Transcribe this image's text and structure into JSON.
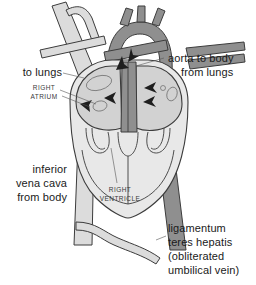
{
  "figure": {
    "background_color": "#ffffff",
    "palette": {
      "vessel_pale": "#dcdcdc",
      "vessel_dark": "#8f8f8f",
      "chamber_fill": "#d2d2d2",
      "ventricle_fill": "#e8e8e8",
      "outline": "#3c3c3c",
      "arrow": "#1e1e1e",
      "text": "#1a1a1a"
    }
  },
  "labels": {
    "to_lungs": "to lungs",
    "right_atrium_line1": "RIGHT",
    "right_atrium_line2": "ATRIUM",
    "aorta_to_body": "aorta to body",
    "from_lungs": "from lungs",
    "inferior_vena_cava_line1": "inferior",
    "inferior_vena_cava_line2": "vena cava",
    "inferior_vena_cava_line3": "from body",
    "right_ventricle_line1": "RIGHT",
    "right_ventricle_line2": "VENTRICLE",
    "ligamentum_line1": "ligamentum",
    "ligamentum_line2": "teres hepatis",
    "ligamentum_line3": "(obliterated",
    "ligamentum_line4": "umbilical vein)"
  },
  "structures": [
    {
      "name": "superior-vena-cava",
      "shade": "pale"
    },
    {
      "name": "brachiocephalic-branch",
      "shade": "pale"
    },
    {
      "name": "aortic-arch",
      "shade": "dark"
    },
    {
      "name": "aortic-arch-branch-1",
      "shade": "dark"
    },
    {
      "name": "aortic-arch-branch-2",
      "shade": "dark"
    },
    {
      "name": "aortic-arch-branch-3",
      "shade": "dark"
    },
    {
      "name": "pulmonary-artery",
      "shade": "dark"
    },
    {
      "name": "pulmonary-veins",
      "shade": "dark"
    },
    {
      "name": "right-atrium",
      "shade": "chamber"
    },
    {
      "name": "left-atrium",
      "shade": "chamber"
    },
    {
      "name": "right-ventricle",
      "shade": "ventricle"
    },
    {
      "name": "left-ventricle",
      "shade": "ventricle"
    },
    {
      "name": "inferior-vena-cava",
      "shade": "pale"
    },
    {
      "name": "descending-aorta",
      "shade": "dark"
    },
    {
      "name": "ligamentum-teres-hepatis",
      "shade": "pale"
    }
  ],
  "flow_arrows": [
    {
      "name": "foramen-ovale-arrow",
      "direction": "left"
    },
    {
      "name": "ductus-arteriosus-arrow",
      "direction": "up"
    },
    {
      "name": "pulmonary-vein-arrow-1",
      "direction": "left"
    },
    {
      "name": "pulmonary-vein-arrow-2",
      "direction": "left"
    },
    {
      "name": "ivc-inflow-arrow",
      "direction": "down-left"
    }
  ]
}
